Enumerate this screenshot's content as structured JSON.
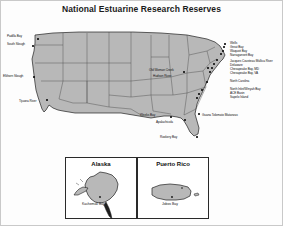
{
  "title": "National Estuarine Research Reserves",
  "colors": {
    "land_fill": "#b8b8b8",
    "land_stroke": "#1f1f1f",
    "state_stroke": "#3d3d3d",
    "text": "#101010",
    "marker": "#111111",
    "background": "#ffffff",
    "frame": "#c9c9c9"
  },
  "map": {
    "name": "contiguous-united-states",
    "west_coast_labels": [
      {
        "label": "Padilla Bay",
        "x": 10,
        "y": 22,
        "anchor": "right",
        "dot_x": 36,
        "dot_y": 24
      },
      {
        "label": "South Slough",
        "x": 2,
        "y": 41,
        "anchor": "right",
        "dot_x": 31,
        "dot_y": 43
      },
      {
        "label": "Elkhorn Slough",
        "x": 0,
        "y": 73,
        "anchor": "right",
        "dot_x": 32,
        "dot_y": 74
      },
      {
        "label": "Tijuana River",
        "x": 16,
        "y": 98,
        "anchor": "right",
        "dot_x": 43,
        "dot_y": 97
      }
    ],
    "interior_labels": [
      {
        "label": "Old Woman Creek",
        "x": 148,
        "y": 53,
        "anchor": "right",
        "dot_x": 182,
        "dot_y": 56
      },
      {
        "label": "Hudson River",
        "x": 152,
        "y": 61,
        "anchor": "right",
        "dot_x": 206,
        "dot_y": 52
      }
    ],
    "east_coast_labels": [
      {
        "label": "Wells",
        "x": 229,
        "y": 41,
        "dot_x": 223,
        "dot_y": 40
      },
      {
        "label": "Great Bay",
        "x": 229,
        "y": 45,
        "dot_x": 222,
        "dot_y": 43
      },
      {
        "label": "Waquoit Bay",
        "x": 229,
        "y": 49,
        "dot_x": 221,
        "dot_y": 47
      },
      {
        "label": "Narragansett Bay",
        "x": 229,
        "y": 53,
        "dot_x": 219,
        "dot_y": 50
      },
      {
        "label": "Jacques Cousteau Mullica River",
        "x": 229,
        "y": 59,
        "dot_x": 215,
        "dot_y": 56
      },
      {
        "label": "Delaware",
        "x": 229,
        "y": 63,
        "dot_x": 212,
        "dot_y": 59
      },
      {
        "label": "Chesapeake Bay, MD",
        "x": 229,
        "y": 67,
        "dot_x": 210,
        "dot_y": 62
      },
      {
        "label": "Chesapeake Bay, VA",
        "x": 229,
        "y": 71,
        "dot_x": 208,
        "dot_y": 66
      },
      {
        "label": "North Carolina",
        "x": 229,
        "y": 79,
        "dot_x": 205,
        "dot_y": 74
      },
      {
        "label": "North Inlet/Winyah Bay",
        "x": 229,
        "y": 87,
        "dot_x": 200,
        "dot_y": 82
      },
      {
        "label": "ACE Basin",
        "x": 229,
        "y": 91,
        "dot_x": 197,
        "dot_y": 86
      },
      {
        "label": "Sapelo Island",
        "x": 229,
        "y": 95,
        "dot_x": 195,
        "dot_y": 90
      },
      {
        "label": "Guana Tolomato Matanzas",
        "x": 229,
        "y": 99,
        "dot_x": 194,
        "dot_y": 96
      }
    ],
    "gulf_labels": [
      {
        "label": "Weeks Bay",
        "x": 139,
        "y": 99,
        "anchor": "right",
        "dot_x": 169,
        "dot_y": 101
      },
      {
        "label": "Apalachicola",
        "x": 157,
        "y": 105,
        "anchor": "right",
        "dot_x": 183,
        "dot_y": 103
      },
      {
        "label": "Rookery Bay",
        "x": 161,
        "y": 121,
        "anchor": "right",
        "dot_x": 194,
        "dot_y": 120
      }
    ]
  },
  "insets": [
    {
      "name": "alaska",
      "title": "Alaska",
      "site": "Kachemak Bay",
      "site_x": 20,
      "site_y": 43
    },
    {
      "name": "puerto-rico",
      "title": "Puerto Rico",
      "site": "Jobos Bay",
      "site_x": 26,
      "site_y": 40
    }
  ]
}
